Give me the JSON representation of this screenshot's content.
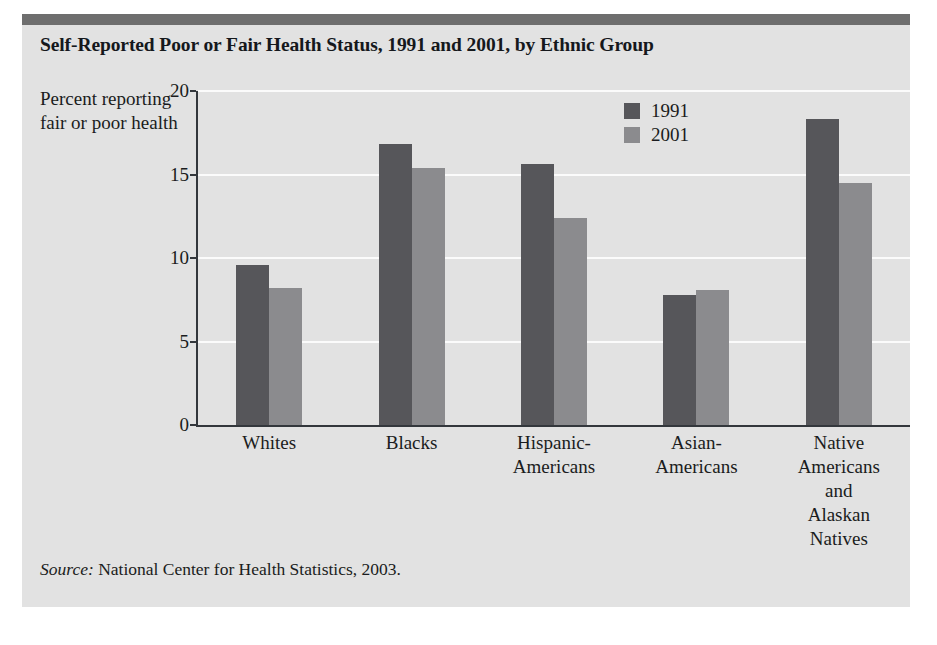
{
  "figure": {
    "title": "Self-Reported Poor or Fair Health Status, 1991 and 2001, by Ethnic Group",
    "source_keyword": "Source:",
    "source_text": " National Center for Health Statistics, 2003."
  },
  "colors": {
    "panel_background": "#e2e2e2",
    "header_rule": "#6e6e6e",
    "series_1991": "#56565a",
    "series_2001": "#8b8b8e",
    "gridline": "#fbfbfb",
    "axis": "#33373c",
    "text": "#1a1c20"
  },
  "chart_data": {
    "type": "bar",
    "title": "Self-Reported Poor or Fair Health Status, 1991 and 2001, by Ethnic Group",
    "xlabel": "",
    "ylabel": "Percent reporting fair or poor health",
    "ylim": [
      0,
      20
    ],
    "yticks": [
      0,
      5,
      10,
      15,
      20
    ],
    "ytick_labels": [
      "0",
      "5",
      "10",
      "15",
      "20"
    ],
    "grid": true,
    "legend_position": "upper right",
    "categories": [
      "Whites",
      "Hispanic-Americans",
      "Blacks",
      "Asian-Americans",
      "Native Americans and Alaskan Natives"
    ],
    "category_labels": [
      "Whites",
      "Blacks",
      "Hispanic-\nAmericans",
      "Asian-\nAmericans",
      "Native\nAmericans\nand\nAlaskan\nNatives"
    ],
    "series": [
      {
        "name": "1991",
        "values": [
          9.6,
          16.8,
          15.6,
          7.8,
          18.3
        ]
      },
      {
        "name": "2001",
        "values": [
          8.2,
          15.4,
          12.4,
          8.1,
          14.5
        ]
      }
    ]
  }
}
